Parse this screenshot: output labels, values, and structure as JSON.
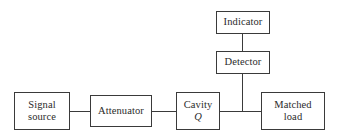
{
  "diagram": {
    "type": "block-diagram",
    "canvas": {
      "width": 339,
      "height": 138
    },
    "colors": {
      "background": "#ffffff",
      "stroke": "#3a3a3a",
      "text": "#2b2b2b"
    },
    "blocks": [
      {
        "id": "indicator",
        "line1": "Indicator",
        "line2": "",
        "x": 216,
        "y": 11,
        "w": 54,
        "h": 23
      },
      {
        "id": "detector",
        "line1": "Detector",
        "line2": "",
        "x": 216,
        "y": 51,
        "w": 54,
        "h": 23
      },
      {
        "id": "signal-source",
        "line1": "Signal",
        "line2": "source",
        "x": 14,
        "y": 92,
        "w": 56,
        "h": 38
      },
      {
        "id": "attenuator",
        "line1": "Attenuator",
        "line2": "",
        "x": 90,
        "y": 95,
        "w": 62,
        "h": 32
      },
      {
        "id": "cavity-q",
        "line1": "Cavity",
        "line2": "Q",
        "x": 176,
        "y": 92,
        "w": 44,
        "h": 38
      },
      {
        "id": "matched-load",
        "line1": "Matched",
        "line2": "load",
        "x": 261,
        "y": 92,
        "w": 64,
        "h": 38
      }
    ],
    "wires": [
      {
        "id": "indicator-to-detector",
        "orient": "v",
        "x": 242,
        "y": 34,
        "len": 17
      },
      {
        "id": "detector-to-bus",
        "orient": "v",
        "x": 242,
        "y": 74,
        "len": 37
      },
      {
        "id": "signal-source-to-attenuator",
        "orient": "h",
        "x": 70,
        "y": 111,
        "len": 20
      },
      {
        "id": "attenuator-to-cavity",
        "orient": "h",
        "x": 152,
        "y": 111,
        "len": 24
      },
      {
        "id": "cavity-to-matched-load",
        "orient": "h",
        "x": 220,
        "y": 111,
        "len": 41
      }
    ]
  }
}
